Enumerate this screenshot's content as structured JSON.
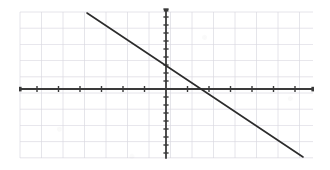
{
  "figure": {
    "name": "cartesian-line-graph",
    "background_color": "#ffffff",
    "width": 330,
    "height": 170
  },
  "chart_data": {
    "type": "line",
    "title": "",
    "subtitle": "",
    "xlabel": "",
    "ylabel": "",
    "grid": true,
    "legend": null,
    "axes": {
      "x_axis": {
        "name": "x-axis",
        "color": "#3a3a3a",
        "orientation": "horizontal",
        "pixel_y": 89,
        "pixel_x_start": 20,
        "pixel_x_end": 313,
        "tick_spacing_px": 21.5,
        "tick_count": 14,
        "tick_labels": [],
        "arrowheads": "both"
      },
      "y_axis": {
        "name": "y-axis",
        "color": "#3a3a3a",
        "orientation": "vertical",
        "pixel_x": 166,
        "pixel_y_start": 10,
        "pixel_y_end": 158,
        "tick_spacing_px": 8,
        "tick_count": 19,
        "tick_labels": [],
        "arrowheads": "top"
      }
    },
    "grid_spec": {
      "color": "#d9d8e0",
      "left": 20,
      "top": 12,
      "right": 313,
      "bottom": 158,
      "cell_width_px": 21.5,
      "cell_height_px": 16.2,
      "vertical_line_count": 14,
      "horizontal_line_count": 10
    },
    "series": [
      {
        "name": "linear-function",
        "color": "#2b2b2b",
        "style": "solid",
        "width_px": 1.6,
        "points_px": [
          [
            87,
            13
          ],
          [
            303,
            157
          ]
        ],
        "slope": -0.667,
        "y_intercept_px": 68,
        "x_intercept_px": 196,
        "data_points": [
          {
            "x": -3.7,
            "y": 4.8
          },
          {
            "x": 1.4,
            "y": 0.0
          },
          {
            "x": 6.4,
            "y": -4.3
          }
        ]
      }
    ],
    "annotations": []
  }
}
